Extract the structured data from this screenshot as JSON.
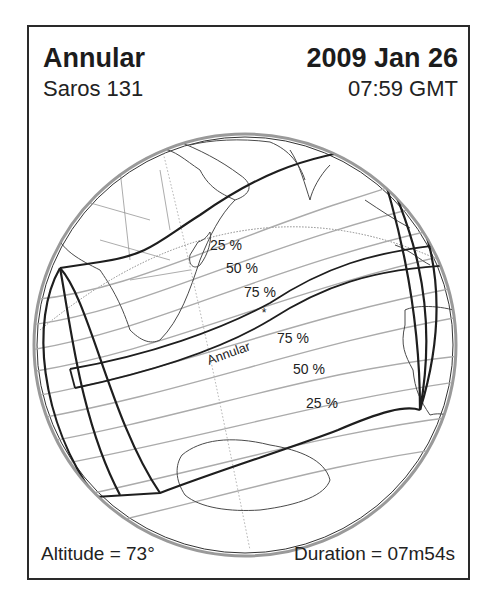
{
  "header": {
    "eclipse_type": "Annular",
    "date": "2009 Jan 26",
    "saros": "Saros 131",
    "time": "07:59 GMT"
  },
  "footer": {
    "altitude": "Altitude = 73°",
    "duration": "Duration = 07m54s"
  },
  "map": {
    "projection": "orthographic globe",
    "path_label": "Annular",
    "north_labels": [
      "25 %",
      "50 %",
      "75 %"
    ],
    "south_labels": [
      "75 %",
      "50 %",
      "25 %"
    ],
    "greatest_eclipse_marker": "*",
    "colors": {
      "frame": "#2a2a2a",
      "path": "#1e1e1e",
      "coastline": "#4a4a4a",
      "magnitude_lines": "#a8a8a8",
      "background": "#ffffff"
    }
  }
}
